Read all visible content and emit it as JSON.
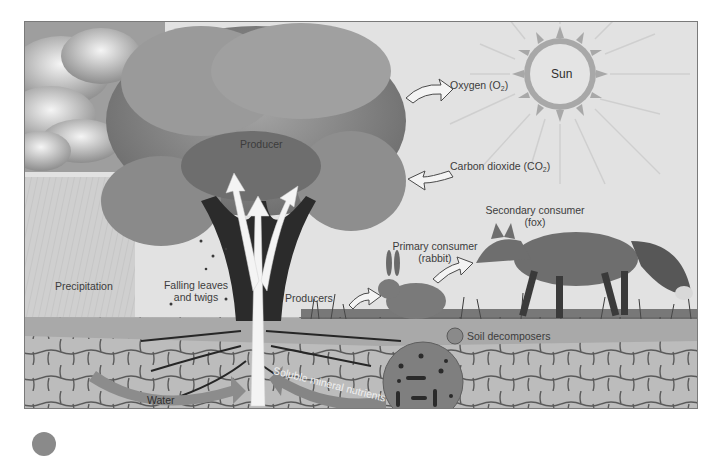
{
  "figure": {
    "style": "grayscale illustration",
    "colors": {
      "sky": "#e2e2e2",
      "cloud": "#f2f2f2",
      "cloud_shadow": "#9a9a9a",
      "canopy": "#8f8f8f",
      "canopy_dark": "#5a5a5a",
      "trunk": "#2b2b2b",
      "arrow_fill": "#f4f4f4",
      "soil_top": "#a8a8a8",
      "soil_stone": "#bdbdbd",
      "soil_crack": "#4a4a4a",
      "band_arrow": "#8c8c8c",
      "decomposer_circle": "#7f7f7f",
      "frame": "#7a7a7a"
    }
  },
  "labels": {
    "sun": "Sun",
    "oxygen": {
      "text": "Oxygen (O",
      "sub": "2",
      "end": ")"
    },
    "carbon_dioxide": {
      "text": "Carbon dioxide (CO",
      "sub": "2",
      "end": ")"
    },
    "producer": "Producer",
    "precipitation": "Precipitation",
    "falling_leaves": {
      "line1": "Falling leaves",
      "line2": "and twigs"
    },
    "producers": "Producers",
    "primary_consumer": {
      "line1": "Primary consumer",
      "line2": "(rabbit)"
    },
    "secondary_consumer": {
      "line1": "Secondary consumer",
      "line2": "(fox)"
    },
    "soil_decomposers": "Soil decomposers",
    "water": "Water",
    "soluble_minerals": "Soluble mineral nutrients"
  },
  "flows": [
    {
      "from": "tree",
      "to": "atmosphere",
      "label": "Oxygen (O2)",
      "direction": "out"
    },
    {
      "from": "atmosphere",
      "to": "tree",
      "label": "Carbon dioxide (CO2)",
      "direction": "in"
    },
    {
      "from": "producers",
      "to": "primary consumer (rabbit)"
    },
    {
      "from": "primary consumer (rabbit)",
      "to": "secondary consumer (fox)"
    },
    {
      "from": "soil",
      "to": "tree roots",
      "label": "Water"
    },
    {
      "from": "soil",
      "to": "tree roots",
      "label": "Soluble mineral nutrients"
    }
  ]
}
